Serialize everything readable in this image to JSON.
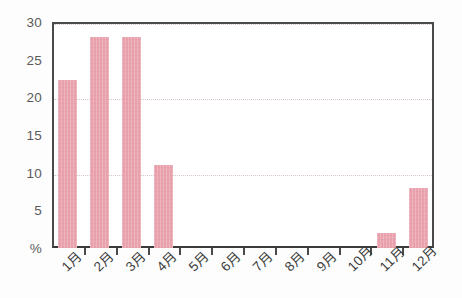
{
  "chart_data": {
    "type": "bar",
    "title": "",
    "subtitle": "",
    "xlabel": "",
    "ylabel": "%",
    "categories": [
      "1月",
      "2月",
      "3月",
      "4月",
      "5月",
      "6月",
      "7月",
      "8月",
      "9月",
      "10月",
      "11月",
      "12月"
    ],
    "values": [
      22.3,
      28.0,
      28.0,
      11.0,
      0,
      0,
      0,
      0,
      0,
      0,
      2.0,
      8.0
    ],
    "ylim": [
      0,
      30
    ],
    "y_ticks": [
      0,
      5,
      10,
      15,
      20,
      25,
      30
    ],
    "y_tick_labels": [
      "%",
      "5",
      "10",
      "15",
      "20",
      "25",
      "30"
    ],
    "gridlines": [
      10,
      20,
      30
    ],
    "grid": true,
    "legend": false,
    "legend_position": "none",
    "series": [
      {
        "name": "",
        "values": [
          22.3,
          28.0,
          28.0,
          11.0,
          0,
          0,
          0,
          0,
          0,
          0,
          2.0,
          8.0
        ]
      }
    ],
    "colors": {
      "bar": "#e9a2ae",
      "axis": "#4a4a4a",
      "grid": "#d8c8cc",
      "tick_label": "#5b5b5b",
      "category_label": "#3d3d3d",
      "background": "#ffffff"
    }
  }
}
